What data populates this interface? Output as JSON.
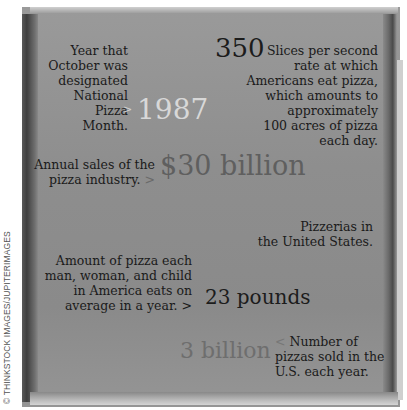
{
  "credit": "© THINKSTOCK IMAGES/JUPITERIMAGES",
  "facts": [
    {
      "value": "1987",
      "caption": "Year that October was designated National Pizza Month.",
      "arrow": ">",
      "lines": [
        "Year that",
        "October was",
        "designated",
        "National Pizza",
        "Month."
      ]
    },
    {
      "value": "350",
      "caption": "Slices per second rate at which Americans eat pizza, which amounts to approximately 100 acres of pizza each day.",
      "lines": [
        "Slices per second",
        "rate at which",
        "Americans eat pizza,",
        "which amounts to",
        "approximately",
        "100 acres of pizza",
        "each day."
      ]
    },
    {
      "value": "$30 billion",
      "caption": "Annual sales of the pizza industry.",
      "arrow": ">",
      "lines": [
        "Annual sales of the",
        "pizza industry."
      ]
    },
    {
      "value": "",
      "caption": "Pizzerias in the United States.",
      "lines": [
        "Pizzerias in",
        "the United States."
      ]
    },
    {
      "value": "23 pounds",
      "caption": "Amount of pizza each man, woman, and child in America eats on average in a year.",
      "arrow": ">",
      "lines": [
        "Amount of pizza each",
        "man, woman, and child",
        "in America eats on",
        "average in a year."
      ]
    },
    {
      "value": "3 billion",
      "caption": "Number of pizzas sold in the U.S. each year.",
      "arrow": "<",
      "lines": [
        "Number of",
        "pizzas sold in the",
        "U.S. each year."
      ]
    }
  ],
  "colors": {
    "value_light": "#d8d8d8",
    "value_dark": "#1c1c1c",
    "value_mid": "#6e6e6e",
    "text": "#1a1a1a"
  }
}
